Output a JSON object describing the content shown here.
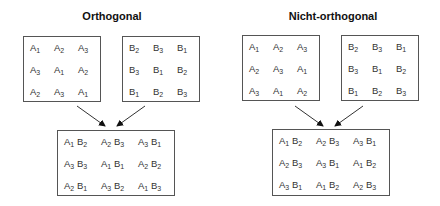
{
  "panels": [
    {
      "title": "Orthogonal",
      "grid_a": [
        [
          "A1",
          "A2",
          "A3"
        ],
        [
          "A3",
          "A1",
          "A2"
        ],
        [
          "A2",
          "A3",
          "A1"
        ]
      ],
      "grid_b": [
        [
          "B2",
          "B3",
          "B1"
        ],
        [
          "B3",
          "B1",
          "B2"
        ],
        [
          "B1",
          "B2",
          "B3"
        ]
      ],
      "combined": [
        [
          "A1 B2",
          "A2 B3",
          "A3 B1"
        ],
        [
          "A3 B3",
          "A1 B1",
          "A2 B2"
        ],
        [
          "A2 B1",
          "A3 B2",
          "A1 B3"
        ]
      ]
    },
    {
      "title": "Nicht-orthogonal",
      "grid_a": [
        [
          "A1",
          "A2",
          "A3"
        ],
        [
          "A2",
          "A3",
          "A1"
        ],
        [
          "A3",
          "A1",
          "A2"
        ]
      ],
      "grid_b": [
        [
          "B2",
          "B3",
          "B1"
        ],
        [
          "B3",
          "B1",
          "B2"
        ],
        [
          "B1",
          "B2",
          "B3"
        ]
      ],
      "combined": [
        [
          "A1 B2",
          "A2 B3",
          "A3 B1"
        ],
        [
          "A2 B3",
          "A3 B1",
          "A1 B2"
        ],
        [
          "A3 B1",
          "A1 B2",
          "A2 B3"
        ]
      ]
    }
  ]
}
